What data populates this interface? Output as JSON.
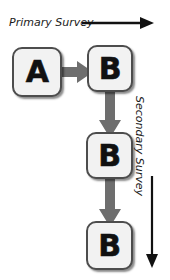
{
  "diagram": {
    "colors": {
      "box_fill": "#f2f2f2",
      "box_border": "#4d4d4d",
      "label_text": "#111111",
      "connector_grey": "#6e6e6e",
      "annotation_black": "#111111",
      "background": "#ffffff"
    },
    "nodes": [
      {
        "id": "a",
        "label": "A",
        "row": 1,
        "column": 1
      },
      {
        "id": "b1",
        "label": "B",
        "row": 1,
        "column": 2
      },
      {
        "id": "b2",
        "label": "B",
        "row": 2,
        "column": 2
      },
      {
        "id": "b3",
        "label": "B",
        "row": 3,
        "column": 2
      }
    ],
    "connectors": [
      {
        "id": "a-b1",
        "from": "a",
        "to": "b1",
        "direction": "right",
        "style": "thick-grey"
      },
      {
        "id": "b1-b2",
        "from": "b1",
        "to": "b2",
        "direction": "down",
        "style": "thick-grey"
      },
      {
        "id": "b2-b3",
        "from": "b2",
        "to": "b3",
        "direction": "down",
        "style": "thick-grey"
      }
    ],
    "annotations": [
      {
        "id": "primary",
        "label": "Primary Survey",
        "orientation": "horizontal",
        "arrow_direction": "right",
        "arrow_icon": "arrow-right-icon"
      },
      {
        "id": "secondary",
        "label": "Secondary Survey",
        "orientation": "vertical",
        "arrow_direction": "down",
        "arrow_icon": "arrow-down-icon"
      }
    ]
  }
}
